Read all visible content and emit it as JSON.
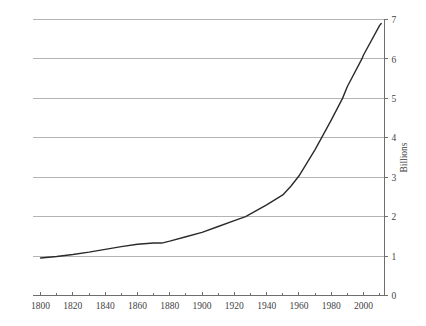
{
  "chart_data": {
    "type": "line",
    "title": "",
    "subtitle": "",
    "xlabel": "",
    "ylabel": "Billions",
    "ylabel_position": "right",
    "xlim": [
      1795,
      2013
    ],
    "ylim": [
      0,
      7
    ],
    "grid": true,
    "grid_axis": "y",
    "legend": false,
    "x_ticks": [
      1800,
      1820,
      1840,
      1860,
      1880,
      1900,
      1920,
      1940,
      1960,
      1980,
      2000
    ],
    "x_tick_labels": [
      "1800",
      "1820",
      "1840",
      "1860",
      "1880",
      "1900",
      "1920",
      "1940",
      "1960",
      "1980",
      "2000"
    ],
    "x_minor_ticks": [
      1810,
      1830,
      1850,
      1870,
      1890,
      1910,
      1930,
      1950,
      1970,
      1990,
      2010
    ],
    "y_ticks": [
      0,
      1,
      2,
      3,
      4,
      5,
      6,
      7
    ],
    "y_tick_labels": [
      "0",
      "1",
      "2",
      "3",
      "4",
      "5",
      "6",
      "7"
    ],
    "series": [
      {
        "name": "World population",
        "x": [
          1800,
          1810,
          1820,
          1830,
          1840,
          1850,
          1860,
          1870,
          1875,
          1880,
          1890,
          1900,
          1910,
          1920,
          1927,
          1930,
          1940,
          1950,
          1955,
          1960,
          1970,
          1974,
          1980,
          1987,
          1990,
          1999,
          2000,
          2010,
          2011
        ],
        "values": [
          0.95,
          0.99,
          1.04,
          1.1,
          1.17,
          1.24,
          1.3,
          1.33,
          1.33,
          1.38,
          1.49,
          1.6,
          1.75,
          1.9,
          2.0,
          2.07,
          2.3,
          2.55,
          2.77,
          3.03,
          3.7,
          4.0,
          4.45,
          5.0,
          5.3,
          6.0,
          6.1,
          6.85,
          6.9
        ],
        "color": "#2b2b2b",
        "line_width": 1.4
      }
    ],
    "colors": {
      "line": "#2b2b2b",
      "gridline": "#b4b4b4",
      "axis": "#6e6e6e",
      "tick_text": "#3f3f3f",
      "background": "#ffffff"
    }
  }
}
